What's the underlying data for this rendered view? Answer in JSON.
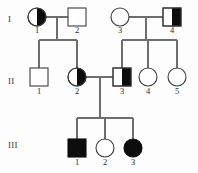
{
  "figure": {
    "type": "pedigree-chart",
    "width": 198,
    "height": 173,
    "background_color": "#fdfdfd",
    "line_color": "#6e6e6e",
    "fill_color": "#0d0d0d",
    "outline_color": "#3c3c3c"
  },
  "generations": [
    {
      "label": "I",
      "y": 22
    },
    {
      "label": "II",
      "y": 84
    },
    {
      "label": "III",
      "y": 148
    }
  ],
  "individuals": [
    {
      "id": "I-1",
      "number": "1",
      "sex": "female",
      "shape": "circle",
      "fill": "half-right",
      "cx": 37,
      "cy": 17,
      "r": 9,
      "label_y": 33
    },
    {
      "id": "I-2",
      "number": "2",
      "sex": "male",
      "shape": "square",
      "fill": "none",
      "cx": 77,
      "cy": 17,
      "r": 9,
      "label_y": 33
    },
    {
      "id": "I-3",
      "number": "3",
      "sex": "female",
      "shape": "circle",
      "fill": "none",
      "cx": 120,
      "cy": 17,
      "r": 9,
      "label_y": 33
    },
    {
      "id": "I-4",
      "number": "4",
      "sex": "male",
      "shape": "square",
      "fill": "half-right",
      "cx": 172,
      "cy": 17,
      "r": 9,
      "label_y": 33
    },
    {
      "id": "II-1",
      "number": "1",
      "sex": "male",
      "shape": "square",
      "fill": "none",
      "cx": 39,
      "cy": 77,
      "r": 9,
      "label_y": 94
    },
    {
      "id": "II-2",
      "number": "2",
      "sex": "female",
      "shape": "circle",
      "fill": "half-right",
      "cx": 77,
      "cy": 77,
      "r": 9,
      "label_y": 94
    },
    {
      "id": "II-3",
      "number": "3",
      "sex": "male",
      "shape": "square",
      "fill": "half-right",
      "cx": 122,
      "cy": 77,
      "r": 9,
      "label_y": 94
    },
    {
      "id": "II-4",
      "number": "4",
      "sex": "female",
      "shape": "circle",
      "fill": "none",
      "cx": 148,
      "cy": 77,
      "r": 9,
      "label_y": 94
    },
    {
      "id": "II-5",
      "number": "5",
      "sex": "female",
      "shape": "circle",
      "fill": "none",
      "cx": 177,
      "cy": 77,
      "r": 9,
      "label_y": 94
    },
    {
      "id": "III-1",
      "number": "1",
      "sex": "male",
      "shape": "square",
      "fill": "full",
      "cx": 77,
      "cy": 148,
      "r": 9,
      "label_y": 165
    },
    {
      "id": "III-2",
      "number": "2",
      "sex": "female",
      "shape": "circle",
      "fill": "none",
      "cx": 105,
      "cy": 148,
      "r": 9,
      "label_y": 165
    },
    {
      "id": "III-3",
      "number": "3",
      "sex": "female",
      "shape": "circle",
      "fill": "full",
      "cx": 133,
      "cy": 148,
      "r": 9,
      "label_y": 165
    }
  ],
  "matings": [
    {
      "id": "mating-I1-I2",
      "partners": [
        "I-1",
        "I-2"
      ],
      "line": {
        "x1": 46,
        "y1": 17,
        "x2": 68,
        "y2": 17
      },
      "descent_x": 57,
      "descent_y2": 40
    },
    {
      "id": "mating-I3-I4",
      "partners": [
        "I-3",
        "I-4"
      ],
      "line": {
        "x1": 129,
        "y1": 17,
        "x2": 163,
        "y2": 17
      },
      "descent_x": 146,
      "descent_y2": 40
    },
    {
      "id": "mating-II2-II3",
      "partners": [
        "II-2",
        "II-3"
      ],
      "line": {
        "x1": 86,
        "y1": 77,
        "x2": 113,
        "y2": 77
      },
      "descent_x": 100,
      "descent_y2": 118
    }
  ],
  "sibships": [
    {
      "id": "sibship-gen2-left",
      "y": 40,
      "x1": 39,
      "x2": 77,
      "children_x": [
        39,
        77
      ]
    },
    {
      "id": "sibship-gen2-right",
      "y": 40,
      "x1": 122,
      "x2": 177,
      "children_x": [
        122,
        148,
        177
      ]
    },
    {
      "id": "sibship-gen3",
      "y": 118,
      "x1": 77,
      "x2": 133,
      "children_x": [
        77,
        105,
        133
      ]
    }
  ]
}
